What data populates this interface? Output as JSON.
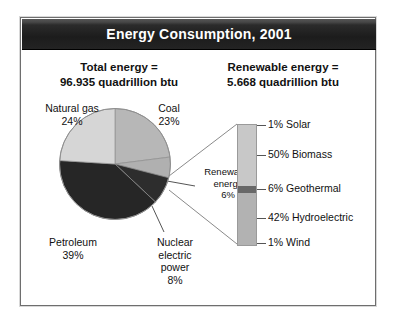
{
  "figure": {
    "title": "Energy Consumption, 2001",
    "headline_total": {
      "line1": "Total energy =",
      "line2": "96.935 quadrillion btu"
    },
    "headline_renewable": {
      "line1": "Renewable energy =",
      "line2": "5.668 quadrillion btu"
    }
  },
  "chart_data": [
    {
      "type": "pie",
      "title": "Total energy = 96.935 quadrillion btu",
      "total_label": "96.935 quadrillion btu",
      "units": "quadrillion btu",
      "total_value": 96.935,
      "categories": [
        "Coal",
        "Renewable energy",
        "Nuclear electric power",
        "Petroleum",
        "Natural gas"
      ],
      "values": [
        23,
        6,
        8,
        39,
        24
      ],
      "value_labels": [
        "23%",
        "6%",
        "8%",
        "39%",
        "24%"
      ],
      "colors": [
        "#b4b4b4",
        "#b4b4b4",
        "#2a2a2a",
        "#2a2a2a",
        "#d5d5d5"
      ],
      "legend": "none",
      "start_angle_deg": 0,
      "direction": "clockwise",
      "labels": [
        {
          "name": "natural-gas",
          "line1": "Natural gas",
          "line2": "24%"
        },
        {
          "name": "coal",
          "line1": "Coal",
          "line2": "23%"
        },
        {
          "name": "petroleum",
          "line1": "Petroleum",
          "line2": "39%"
        },
        {
          "name": "nuclear",
          "line1": "Nuclear",
          "line2": "electric",
          "line3": "power",
          "line4": "8%"
        },
        {
          "name": "renewable",
          "line1": "Renewable",
          "line2": "energy",
          "line3": "6%"
        }
      ]
    },
    {
      "type": "bar",
      "orientation": "stacked-vertical",
      "title": "Renewable energy = 5.668 quadrillion btu",
      "total_label": "5.668 quadrillion btu",
      "units": "quadrillion btu",
      "total_value": 5.668,
      "categories": [
        "Solar",
        "Biomass",
        "Geothermal",
        "Hydroelectric",
        "Wind"
      ],
      "values": [
        1,
        50,
        6,
        42,
        1
      ],
      "value_labels": [
        "1% Solar",
        "50% Biomass",
        "6% Geothermal",
        "42% Hydroelectric",
        "1% Wind"
      ],
      "colors": [
        "#c6c6c6",
        "#c6c6c6",
        "#6a6a6a",
        "#b0b0b0",
        "#b0b0b0"
      ],
      "ylim": [
        0,
        100
      ],
      "grid": false,
      "legend": "right"
    }
  ],
  "pie_slices": [
    {
      "name": "coal",
      "label": "Coal",
      "pct": 23,
      "color": "#b7b7b7"
    },
    {
      "name": "renewable",
      "label": "Renewable energy",
      "pct": 6,
      "color": "#b0b0b0"
    },
    {
      "name": "nuclear",
      "label": "Nuclear electric power",
      "pct": 8,
      "color": "#2d2d2d"
    },
    {
      "name": "petroleum",
      "label": "Petroleum",
      "pct": 39,
      "color": "#262626"
    },
    {
      "name": "naturalgas",
      "label": "Natural gas",
      "pct": 24,
      "color": "#d6d6d6"
    }
  ],
  "renewable_segments": [
    {
      "name": "solar",
      "label": "1% Solar",
      "pct": 1,
      "color": "#c8c8c8"
    },
    {
      "name": "biomass",
      "label": "50% Biomass",
      "pct": 50,
      "color": "#c8c8c8"
    },
    {
      "name": "geothermal",
      "label": "6% Geothermal",
      "pct": 6,
      "color": "#686868"
    },
    {
      "name": "hydroelectric",
      "label": "42% Hydroelectric",
      "pct": 42,
      "color": "#b2b2b2"
    },
    {
      "name": "wind",
      "label": "1% Wind",
      "pct": 1,
      "color": "#b2b2b2"
    }
  ],
  "colors": {
    "banner_bg": "#1c1c1c",
    "banner_text": "#ffffff",
    "frame_border": "#6e6e6e",
    "text": "#111111",
    "leader_line": "#555555"
  }
}
